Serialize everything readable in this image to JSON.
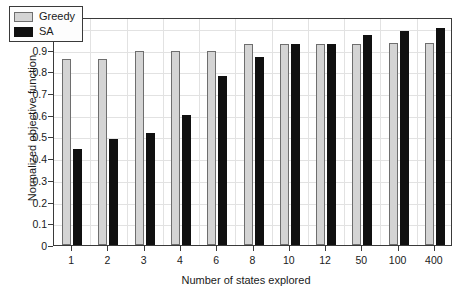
{
  "chart_data": {
    "type": "bar",
    "title": "",
    "xlabel": "Number of states explored",
    "ylabel": "Normalized objective function",
    "categories": [
      "1",
      "2",
      "3",
      "4",
      "6",
      "8",
      "10",
      "12",
      "50",
      "100",
      "400"
    ],
    "series": [
      {
        "name": "Greedy",
        "color": "#d4d4d4",
        "values": [
          0.855,
          0.855,
          0.895,
          0.895,
          0.895,
          0.925,
          0.925,
          0.925,
          0.925,
          0.93,
          0.93
        ]
      },
      {
        "name": "SA",
        "color": "#101010",
        "values": [
          0.44,
          0.49,
          0.515,
          0.6,
          0.78,
          0.865,
          0.925,
          0.925,
          0.965,
          0.985,
          1.0
        ]
      }
    ],
    "ylim": [
      0,
      1.05
    ],
    "yticks": [
      "0",
      "0.1",
      "0.2",
      "0.3",
      "0.4",
      "0.5",
      "0.6",
      "0.7",
      "0.8",
      "0.9",
      "1"
    ],
    "ytick_values": [
      0,
      0.1,
      0.2,
      0.3,
      0.4,
      0.5,
      0.6,
      0.7,
      0.8,
      0.9,
      1.0
    ],
    "grid": true,
    "legend_position": "top-left"
  },
  "legend": {
    "entries": [
      {
        "label": "Greedy"
      },
      {
        "label": "SA"
      }
    ]
  }
}
